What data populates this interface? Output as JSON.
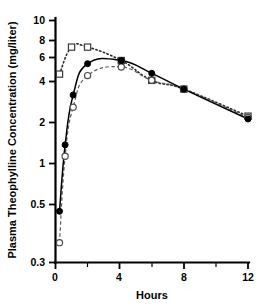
{
  "chart_data": {
    "type": "line",
    "title": "",
    "xlabel": "Hours",
    "ylabel": "Plasma Theophylline Concentration (mg/liter)",
    "xlim": [
      0,
      12
    ],
    "ylim": [
      0.3,
      10
    ],
    "yscale": "log",
    "xscale": "linear",
    "grid": false,
    "legend": "none",
    "x_ticks_major": [
      "0",
      "4",
      "8",
      "12"
    ],
    "x_ticks_major_values": [
      0,
      4,
      8,
      12
    ],
    "x_ticks_minor_values": [
      2,
      6,
      10
    ],
    "y_ticks": [
      "0.3",
      "0.5",
      "1",
      "2",
      "4",
      "6",
      "8",
      "10"
    ],
    "y_ticks_values": [
      0.3,
      0.5,
      1,
      2,
      4,
      6,
      8,
      10
    ],
    "series": [
      {
        "name": "open-square-dotted",
        "marker": "open-square",
        "linestyle": "dotted",
        "x": [
          0.25,
          1.0,
          2.0,
          4.1,
          6.0,
          8.0,
          12.0
        ],
        "values": [
          4.6,
          6.8,
          6.8,
          5.6,
          4.2,
          3.7,
          2.5
        ]
      },
      {
        "name": "filled-circle-solid",
        "marker": "filled-circle",
        "linestyle": "solid",
        "x": [
          0.25,
          0.6,
          1.1,
          2.0,
          4.1,
          6.0,
          8.0,
          12.0
        ],
        "values": [
          0.63,
          1.65,
          3.4,
          5.35,
          5.6,
          4.65,
          3.7,
          2.4
        ]
      },
      {
        "name": "open-circle-dashed",
        "marker": "open-circle",
        "linestyle": "dashed",
        "x": [
          0.25,
          0.6,
          1.1,
          2.0,
          4.1,
          6.0,
          8.0,
          12.0
        ],
        "values": [
          0.4,
          1.4,
          2.85,
          4.5,
          5.1,
          4.2,
          3.7,
          2.45
        ]
      }
    ]
  },
  "axes": {
    "x_label": "Hours",
    "y_label": "Plasma Theophylline Concentration (mg/liter)"
  },
  "x_tick_labels": [
    "0",
    "4",
    "8",
    "12"
  ],
  "y_tick_labels": [
    "10",
    "8",
    "6",
    "4",
    "2",
    "1",
    "0.5",
    "0.3"
  ],
  "colors": {
    "axis": "#000000",
    "solid_series": "#000000",
    "dashed_series": "#5a5a5a",
    "dotted_series": "#2a2a2a",
    "background": "#ffffff"
  }
}
